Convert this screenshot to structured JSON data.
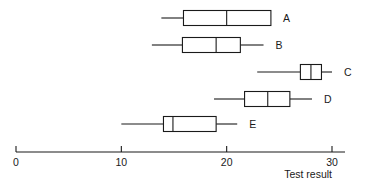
{
  "chart_data": {
    "type": "boxplot",
    "title": "",
    "subtitle": "",
    "xlabel": "Test result",
    "ylabel": "",
    "orientation": "horizontal",
    "grid": false,
    "legend": "none",
    "xlim": [
      0,
      31
    ],
    "xticks": [
      0,
      10,
      20,
      30
    ],
    "xtick_labels": [
      "0",
      "10",
      "20",
      "30"
    ],
    "categories": [
      "A",
      "B",
      "C",
      "D",
      "E"
    ],
    "boxes": [
      {
        "label": "A",
        "whisker_low": 13.8,
        "q1": 15.9,
        "median": 20.0,
        "q3": 24.2,
        "whisker_high": 24.2
      },
      {
        "label": "B",
        "whisker_low": 12.9,
        "q1": 15.8,
        "median": 19.0,
        "q3": 21.3,
        "whisker_high": 23.5
      },
      {
        "label": "C",
        "whisker_low": 22.9,
        "q1": 27.0,
        "median": 28.0,
        "q3": 29.0,
        "whisker_high": 30.0
      },
      {
        "label": "D",
        "whisker_low": 18.8,
        "q1": 21.7,
        "median": 23.9,
        "q3": 26.0,
        "whisker_high": 28.1
      },
      {
        "label": "E",
        "whisker_low": 10.0,
        "q1": 14.0,
        "median": 14.9,
        "q3": 19.0,
        "whisker_high": 21.0
      }
    ],
    "colors": {
      "stroke": "#1a1a1a",
      "box_fill": "#ffffff",
      "background": "#ffffff",
      "text": "#1a1a1a"
    }
  },
  "axis": {
    "title": "Test result",
    "tick_labels": [
      "0",
      "10",
      "20",
      "30"
    ]
  },
  "series_labels": {
    "a": "A",
    "b": "B",
    "c": "C",
    "d": "D",
    "e": "E"
  }
}
